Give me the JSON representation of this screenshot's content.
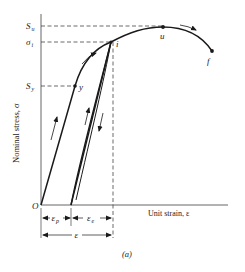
{
  "figure": {
    "caption": "(a)",
    "y_axis_label": "Nominal stress, σ",
    "x_axis_label": "Unit strain, ε",
    "origin_label": "O",
    "stress_levels": {
      "ultimate": {
        "label_main": "S",
        "label_sub": "u"
      },
      "instantaneous": {
        "label_main": "σ",
        "label_sub": "i"
      },
      "yield": {
        "label_main": "S",
        "label_sub": "y"
      }
    },
    "points": {
      "yield_point": "y",
      "instant_point": "i",
      "ultimate_point": "u",
      "fracture_point": "f"
    },
    "strain_dimensions": {
      "plastic": {
        "label_main": "ε",
        "label_sub": "p"
      },
      "elastic": {
        "label_main": "ε",
        "label_sub": "e"
      },
      "total": {
        "label_main": "ε"
      }
    },
    "colors": {
      "curve": "#1a1a1a",
      "axis": "#555555",
      "dashed": "#444444"
    }
  }
}
